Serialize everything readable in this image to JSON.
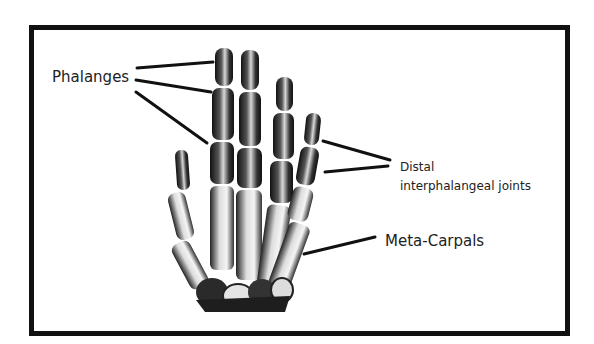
{
  "diagram": {
    "labels": {
      "phalanges": "Phalanges",
      "distal_line1": "Distal",
      "distal_line2": "interphalangeal joints",
      "metacarpals": "Meta-Carpals"
    },
    "colors": {
      "border": "#111111",
      "bone_dark": "#1a1a1a",
      "bone_light": "#e8e8e8",
      "text": "#222222",
      "background": "#ffffff"
    }
  }
}
